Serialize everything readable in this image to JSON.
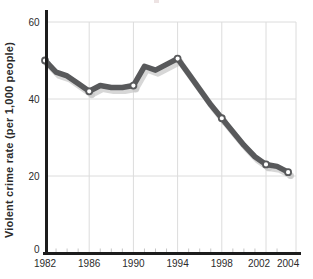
{
  "figure": {
    "background": "#ffffff"
  },
  "chart_data": {
    "type": "line",
    "title": "",
    "xlabel": "",
    "ylabel": "Violent crime rate (per 1,000 people)",
    "xlim": [
      1982,
      2004
    ],
    "ylim": [
      0,
      60
    ],
    "grid": true,
    "legend": false,
    "x": [
      1982,
      1983,
      1984,
      1985,
      1986,
      1987,
      1988,
      1989,
      1990,
      1991,
      1992,
      1993,
      1994,
      1995,
      1996,
      1997,
      1998,
      1999,
      2000,
      2001,
      2002,
      2003,
      2004
    ],
    "y": [
      50,
      47,
      46,
      44,
      42,
      43.5,
      43,
      43,
      43.5,
      48.5,
      47.5,
      49,
      50.5,
      46.5,
      42.5,
      38.5,
      35,
      31.5,
      28,
      25,
      23,
      22.5,
      21
    ],
    "marker_years": [
      1982,
      1986,
      1990,
      1994,
      1998,
      2002,
      2004
    ],
    "x_tick_years": [
      1982,
      1986,
      1990,
      1994,
      1998,
      2002,
      2004
    ],
    "x_tick_labels": [
      "1982",
      "1986",
      "1990",
      "1994",
      "1998",
      "2002",
      "2004"
    ],
    "y_tick_values": [
      0,
      20,
      40,
      60
    ],
    "y_tick_labels": [
      "0",
      "20",
      "40",
      "60"
    ]
  },
  "colors": {
    "background": "#ffffff",
    "line": "#58595b",
    "line_shadow": "#c9c9c9",
    "marker_fill": "#ffffff",
    "grid": "#dcdcdc",
    "minor_tick": "#c6c6c6",
    "axis": "#1c1c1c",
    "tick_text": "#2b2b2b",
    "artifact": "#e9dcdc"
  }
}
